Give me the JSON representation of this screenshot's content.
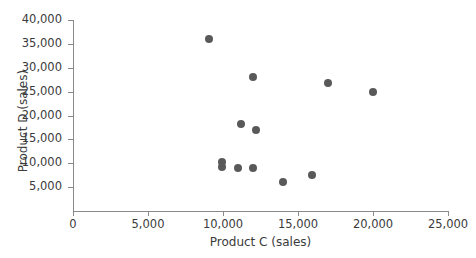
{
  "chart_data": {
    "type": "scatter",
    "title": "",
    "xlabel": "Product C (sales)",
    "ylabel": "Product D (sales)",
    "xlim": [
      0,
      25000
    ],
    "ylim": [
      0,
      40000
    ],
    "xticks": [
      0,
      5000,
      10000,
      15000,
      20000,
      25000
    ],
    "yticks": [
      5000,
      10000,
      15000,
      20000,
      25000,
      30000,
      35000,
      40000
    ],
    "xtick_labels": [
      "0",
      "5,000",
      "10,000",
      "15,000",
      "20,000",
      "25,000"
    ],
    "ytick_labels": [
      "5,000",
      "10,000",
      "15,000",
      "20,000",
      "25,000",
      "30,000",
      "35,000",
      "40,000"
    ],
    "grid": false,
    "legend": null,
    "marker_color": "#595959",
    "axis_color": "#8a8a8a",
    "points": [
      {
        "x": 9050,
        "y": 36000
      },
      {
        "x": 12000,
        "y": 28000
      },
      {
        "x": 17000,
        "y": 26800
      },
      {
        "x": 20000,
        "y": 24900
      },
      {
        "x": 11200,
        "y": 18200
      },
      {
        "x": 12200,
        "y": 17000
      },
      {
        "x": 9900,
        "y": 10300
      },
      {
        "x": 9900,
        "y": 9200
      },
      {
        "x": 11000,
        "y": 9000
      },
      {
        "x": 12000,
        "y": 9000
      },
      {
        "x": 14000,
        "y": 6000
      },
      {
        "x": 15900,
        "y": 7600
      }
    ]
  }
}
